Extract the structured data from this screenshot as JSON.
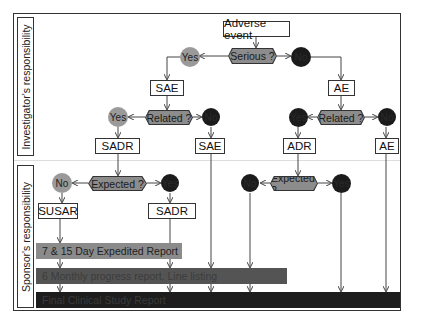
{
  "sections": {
    "investigator_label": "Investigator's responsibility",
    "sponsor_label": "Sponsor's responsibility"
  },
  "nodes": {
    "start": "Adverse event",
    "serious_q": "Serious ?",
    "serious_yes": "Yes",
    "serious_no": "No",
    "sae_1": "SAE",
    "ae_1": "AE",
    "related_q_left": "Related ?",
    "related_left_yes": "Yes",
    "related_left_no": "No",
    "related_q_right": "Related ?",
    "related_right_yes": "Yes",
    "related_right_no": "No",
    "sadr_1": "SADR",
    "sae_2": "SAE",
    "adr": "ADR",
    "ae_2": "AE",
    "expected_q_left": "Expected ?",
    "expected_left_no": "No",
    "expected_left_yes": "Yes",
    "expected_q_right": "Expected ?",
    "expected_right_no": "No",
    "expected_right_yes": "Yes",
    "susar": "SUSAR",
    "sadr_2": "SADR"
  },
  "reports": [
    {
      "label": "7 & 15 Day Expedited Report",
      "color": "#8b8b8b"
    },
    {
      "label": "6 Monthly progress report. Line listing",
      "color": "#545454"
    },
    {
      "label": "Final Clinical Study Report",
      "color": "#1d1d1d"
    }
  ],
  "colors": {
    "yes_circle": "#9a9a9a",
    "no_circle": "#1b1b1b",
    "decision": "#8c8c8c"
  }
}
